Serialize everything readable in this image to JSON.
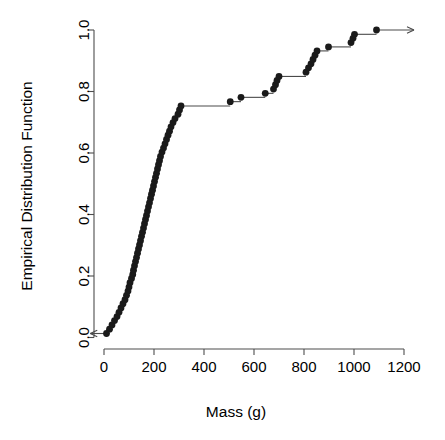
{
  "chart_data": {
    "type": "line",
    "title": "",
    "subtitle": "",
    "xlabel": "Mass (g)",
    "ylabel": "Empirical Distribution Function",
    "xlim": [
      -60,
      1260
    ],
    "ylim": [
      -0.02,
      1.03
    ],
    "xticks": [
      0,
      200,
      400,
      600,
      800,
      1000,
      1200
    ],
    "xticklabels": [
      "0",
      "200",
      "400",
      "600",
      "800",
      "1000",
      "1200"
    ],
    "yticks": [
      0.0,
      0.2,
      0.4,
      0.6,
      0.8,
      1.0
    ],
    "yticklabels": [
      "0.0",
      "0.2",
      "0.4",
      "0.6",
      "0.8",
      "1.0"
    ],
    "grid": false,
    "legend": false,
    "plot_style": "ecdf-step",
    "marker": "filled-circle",
    "annotations": [
      {
        "name": "left-tail-arrow",
        "from_x": 10,
        "from_y": 0.013,
        "to_x": -55,
        "to_y": 0.013,
        "direction": "left"
      },
      {
        "name": "right-tail-arrow",
        "from_x": 1090,
        "from_y": 1.0,
        "to_x": 1240,
        "to_y": 1.0,
        "direction": "right"
      }
    ],
    "x": [
      10,
      22,
      32,
      42,
      52,
      60,
      68,
      76,
      84,
      90,
      96,
      100,
      104,
      110,
      115,
      118,
      122,
      126,
      130,
      134,
      138,
      142,
      146,
      150,
      154,
      158,
      162,
      166,
      170,
      174,
      178,
      182,
      186,
      190,
      194,
      198,
      202,
      206,
      210,
      214,
      218,
      222,
      226,
      232,
      238,
      244,
      250,
      256,
      262,
      268,
      276,
      284,
      296,
      302,
      308,
      505,
      548,
      645,
      678,
      686,
      692,
      700,
      808,
      818,
      828,
      836,
      844,
      852,
      898,
      988,
      996,
      1002,
      1090
    ],
    "y": [
      0.013,
      0.027,
      0.041,
      0.055,
      0.068,
      0.082,
      0.096,
      0.11,
      0.123,
      0.137,
      0.151,
      0.164,
      0.178,
      0.192,
      0.205,
      0.219,
      0.233,
      0.247,
      0.26,
      0.274,
      0.288,
      0.301,
      0.315,
      0.329,
      0.342,
      0.356,
      0.37,
      0.384,
      0.397,
      0.411,
      0.425,
      0.438,
      0.452,
      0.466,
      0.479,
      0.493,
      0.507,
      0.521,
      0.534,
      0.548,
      0.562,
      0.575,
      0.589,
      0.603,
      0.616,
      0.63,
      0.644,
      0.658,
      0.671,
      0.685,
      0.699,
      0.712,
      0.726,
      0.74,
      0.753,
      0.767,
      0.781,
      0.794,
      0.808,
      0.822,
      0.836,
      0.849,
      0.863,
      0.877,
      0.89,
      0.904,
      0.918,
      0.932,
      0.945,
      0.959,
      0.973,
      0.986,
      1.0
    ],
    "note": "Empirical distribution function (ECDF) of masses; 73 observations, each step rises 1/73."
  },
  "axes": {
    "x_title": "Mass (g)",
    "y_title": "Empirical Distribution Function"
  }
}
